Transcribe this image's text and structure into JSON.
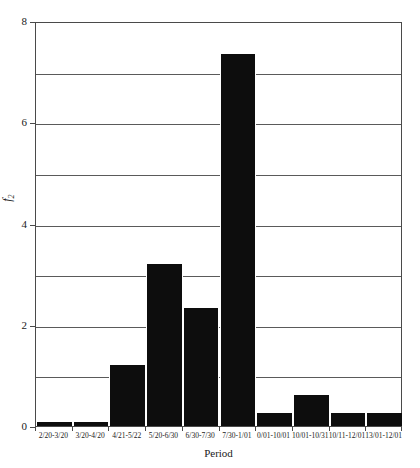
{
  "chart_data": {
    "type": "bar",
    "title": "",
    "xlabel": "Period",
    "ylabel": "f2",
    "ylabel_base": "f",
    "ylabel_sub": "2",
    "ylim": [
      0,
      8
    ],
    "yticks": [
      0,
      2,
      4,
      6,
      8
    ],
    "ytick_labels": [
      "0",
      "2",
      "4",
      "6",
      "8"
    ],
    "yminor": [
      1,
      3,
      5,
      7
    ],
    "grid": true,
    "grid_axis": "y",
    "legend": "none",
    "bar_color": "#0d0d0d",
    "frame_color": "#4a4a4a",
    "categories": [
      "2/20-3/20",
      "3/20-4/20",
      "4/21-5/22",
      "5/20-6/30",
      "6/30-7/30",
      "7/30-1/01",
      "0/01-10/01",
      "10/01-10/31",
      "10/11-12/01",
      "13/01-12/01"
    ],
    "values": [
      0.08,
      0.08,
      1.2,
      3.2,
      2.33,
      7.35,
      0.26,
      0.62,
      0.26,
      0.26
    ]
  }
}
